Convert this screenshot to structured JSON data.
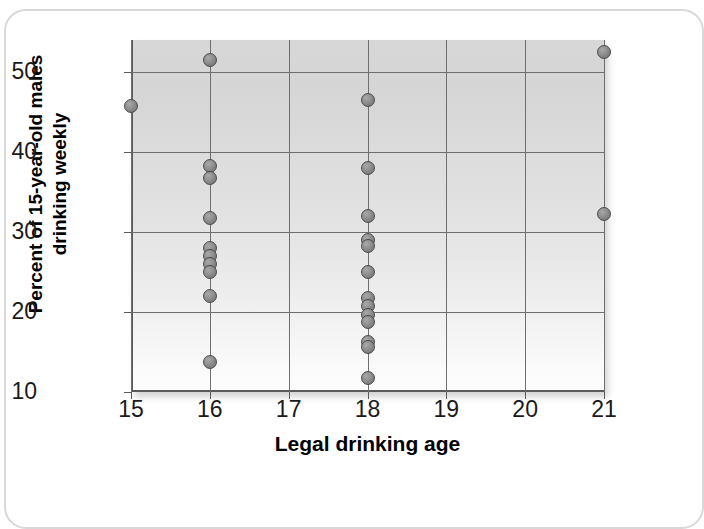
{
  "chart_data": {
    "type": "scatter",
    "title": "",
    "xlabel": "Legal drinking age",
    "ylabel": "Percent of 15-year-old males\ndrinking weekly",
    "xlim": [
      15,
      21
    ],
    "ylim": [
      10,
      54
    ],
    "xticks": [
      "15",
      "16",
      "17",
      "18",
      "19",
      "20",
      "21"
    ],
    "yticks": [
      "10",
      "20",
      "30",
      "40",
      "50"
    ],
    "xtick_values": [
      15,
      16,
      17,
      18,
      19,
      20,
      21
    ],
    "ytick_values": [
      10,
      20,
      30,
      40,
      50
    ],
    "grid": true,
    "legend": "none",
    "marker": "filled-gray-circle",
    "points": [
      {
        "x": 15,
        "y": 45.8
      },
      {
        "x": 16,
        "y": 51.5
      },
      {
        "x": 16,
        "y": 38.3
      },
      {
        "x": 16,
        "y": 36.8
      },
      {
        "x": 16,
        "y": 31.7
      },
      {
        "x": 16,
        "y": 28.0
      },
      {
        "x": 16,
        "y": 27.0
      },
      {
        "x": 16,
        "y": 26.0
      },
      {
        "x": 16,
        "y": 25.0
      },
      {
        "x": 16,
        "y": 22.0
      },
      {
        "x": 16,
        "y": 13.7
      },
      {
        "x": 18,
        "y": 46.5
      },
      {
        "x": 18,
        "y": 38.0
      },
      {
        "x": 18,
        "y": 32.0
      },
      {
        "x": 18,
        "y": 29.0
      },
      {
        "x": 18,
        "y": 28.2
      },
      {
        "x": 18,
        "y": 25.0
      },
      {
        "x": 18,
        "y": 21.8
      },
      {
        "x": 18,
        "y": 20.8
      },
      {
        "x": 18,
        "y": 19.6
      },
      {
        "x": 18,
        "y": 18.8
      },
      {
        "x": 18,
        "y": 16.3
      },
      {
        "x": 18,
        "y": 15.6
      },
      {
        "x": 18,
        "y": 11.8
      },
      {
        "x": 21,
        "y": 52.5
      },
      {
        "x": 21,
        "y": 32.2
      }
    ],
    "colors": {
      "marker_fill": "#8e8e8e",
      "marker_edge": "#4a4a4a",
      "grid_line": "#6e6e6e",
      "axis_line": "#5a5a5a",
      "plot_bg_top": "#d7d7d7",
      "plot_bg_bottom": "#fdfdfd",
      "page_bg": "#ffffff",
      "frame_border": "#d8d8d8",
      "text": "#000000"
    }
  }
}
